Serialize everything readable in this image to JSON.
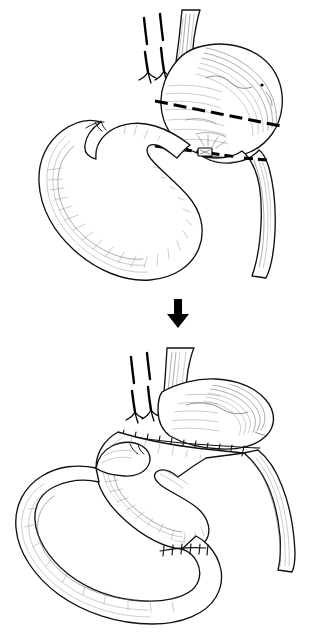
{
  "figure": {
    "background_color": "#ffffff",
    "ink_color": "#111111",
    "hatch_color": "#5a5a5a",
    "width": 314,
    "height": 643,
    "style": "pen-and-ink line drawing",
    "top_caption": ""
  },
  "panels": [
    {
      "id": "panel-before",
      "label": "Before: planned resection lines",
      "order": 1,
      "description": "Stomach with vagal trunks divided, dashed transection line across the gastric body and a second dashed transection line across the duodenum, with jejunal loop below.",
      "structures": [
        {
          "name": "esophagus",
          "label": "Esophagus"
        },
        {
          "name": "vagus-nerve-trunks",
          "label": "Divided vagus nerve trunks"
        },
        {
          "name": "stomach-fundus",
          "label": "Gastric fundus"
        },
        {
          "name": "stomach-body",
          "label": "Gastric body"
        },
        {
          "name": "gastric-transection-line",
          "label": "Gastric transection line"
        },
        {
          "name": "duodenal-transection-line",
          "label": "Duodenal transection line"
        },
        {
          "name": "duodenum",
          "label": "Duodenum"
        },
        {
          "name": "jejunal-loop",
          "label": "Jejunal loop"
        },
        {
          "name": "jejunal-blind-end",
          "label": "Jejunal blind end"
        }
      ],
      "markers": {
        "gastric_cut": "dashed transection line",
        "duodenal_cut": "dashed transection line",
        "nerve_count": 2,
        "serosal_dot": "surface landmark"
      }
    },
    {
      "id": "panel-after",
      "label": "After: completed reconstruction",
      "order": 2,
      "description": "Gastric pouch anastomosed to jejunal limb with a running suture line, and a second suture line at the jejunojejunostomy below.",
      "structures": [
        {
          "name": "esophagus",
          "label": "Esophagus"
        },
        {
          "name": "vagus-nerve-trunks",
          "label": "Divided vagus nerve trunks"
        },
        {
          "name": "gastric-pouch",
          "label": "Gastric pouch"
        },
        {
          "name": "gastrojejunal-anastomosis",
          "label": "Gastrojejunal anastomosis"
        },
        {
          "name": "jejunal-roux-limb",
          "label": "Roux limb"
        },
        {
          "name": "jejunojejunostomy",
          "label": "Jejunojejunostomy"
        },
        {
          "name": "efferent-limb",
          "label": "Efferent limb"
        },
        {
          "name": "jejunal-blind-end",
          "label": "Jejunal blind end"
        }
      ],
      "markers": {
        "gastrojejunal_stitches": 11,
        "jejunojejunal_stitches": 6,
        "nerve_count": 2
      }
    }
  ],
  "connector": {
    "name": "progression-arrow",
    "glyph": "▼",
    "direction": "down",
    "meaning": "leads to next surgical step",
    "color": "#000000"
  }
}
